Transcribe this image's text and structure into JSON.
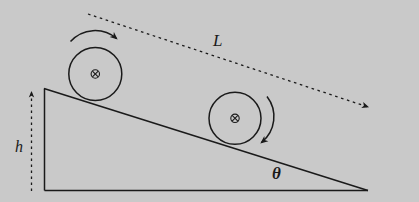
{
  "figure": {
    "background_color": "#c9c9c9",
    "stroke_color": "#1a1a1a",
    "width": 419,
    "height": 202
  },
  "labels": {
    "length": "L",
    "height": "h",
    "angle": "θ"
  },
  "incline": {
    "name": "right-triangle-incline",
    "apex_top_left": [
      44,
      88
    ],
    "vertex_bottom_left": [
      44,
      190
    ],
    "vertex_bottom_right": [
      368,
      190
    ]
  },
  "height_indicator": {
    "name": "height-dimension-arrow",
    "style": "dashed",
    "arrow_direction": "up",
    "x": 31,
    "y_top": 89,
    "y_bottom": 191
  },
  "length_indicator": {
    "name": "length-dimension-arrow",
    "style": "dashed",
    "arrow_direction": "down-right",
    "start": [
      88,
      14
    ],
    "end": [
      371,
      108
    ]
  },
  "disks": [
    {
      "name": "disk-upper-left",
      "center": [
        95,
        74
      ],
      "radius": 26.5,
      "center_marker": "circled-cross",
      "spin_arrow": {
        "name": "rotation-arrow-clockwise",
        "direction": "clockwise",
        "position": "above"
      }
    },
    {
      "name": "disk-lower-right",
      "center": [
        235,
        118
      ],
      "radius": 26,
      "center_marker": "circled-cross",
      "spin_arrow": {
        "name": "rotation-arrow-clockwise",
        "direction": "clockwise",
        "position": "right"
      }
    }
  ]
}
